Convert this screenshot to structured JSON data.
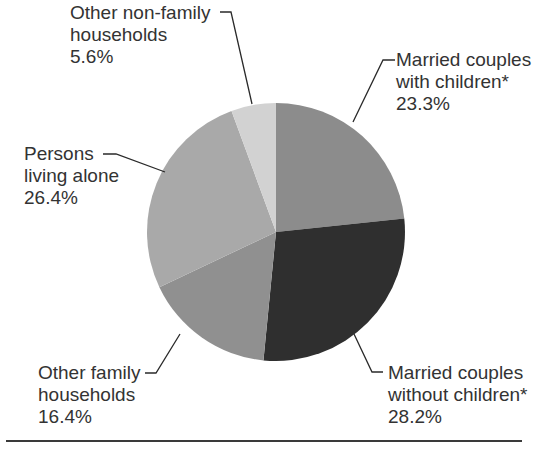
{
  "chart_data": {
    "type": "pie",
    "title": "",
    "start_angle_deg": 0,
    "direction": "clockwise",
    "slices": [
      {
        "label": "Married couples with children*",
        "value": 23.3,
        "display": "23.3%",
        "color": "#8c8c8c"
      },
      {
        "label": "Married couples without children*",
        "value": 28.2,
        "display": "28.2%",
        "color": "#2f2f2f"
      },
      {
        "label": "Other family households",
        "value": 16.4,
        "display": "16.4%",
        "color": "#909090"
      },
      {
        "label": "Persons living alone",
        "value": 26.4,
        "display": "26.4%",
        "color": "#a9a9a9"
      },
      {
        "label": "Other non-family households",
        "value": 5.6,
        "display": "5.6%",
        "color": "#d2d2d2"
      }
    ]
  },
  "labels": {
    "married_with": {
      "line1": "Married couples",
      "line2": "with children*",
      "pct": "23.3%"
    },
    "married_without": {
      "line1": "Married couples",
      "line2": "without children*",
      "pct": "28.2%"
    },
    "other_family": {
      "line1": "Other family",
      "line2": "households",
      "pct": "16.4%"
    },
    "alone": {
      "line1": "Persons",
      "line2": "living alone",
      "pct": "26.4%"
    },
    "other_nonfamily": {
      "line1": "Other non-family",
      "line2": "households",
      "pct": "5.6%"
    }
  }
}
